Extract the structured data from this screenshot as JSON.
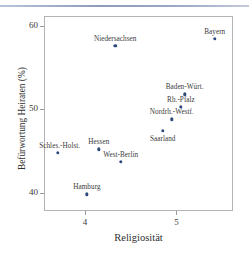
{
  "chart_data": {
    "type": "scatter",
    "title": "",
    "xlabel": "Religiosität",
    "ylabel": "Befürwortung Heiraten (%)",
    "xlim": [
      3.55,
      5.62
    ],
    "ylim": [
      37.8,
      61.2
    ],
    "xticks": [
      4,
      5
    ],
    "xticklabels": [
      "4",
      "5"
    ],
    "yticks": [
      40,
      50,
      60
    ],
    "yticklabels": [
      "40",
      "50",
      "60"
    ],
    "grid": false,
    "legend": null,
    "marker_color": "#2e4a7d",
    "points": [
      {
        "label": "Schles.-Holst.",
        "x": 3.7,
        "y": 44.8,
        "label_pos": "left-above"
      },
      {
        "label": "Hamburg",
        "x": 4.02,
        "y": 39.8,
        "label_pos": "above"
      },
      {
        "label": "Hessen",
        "x": 4.15,
        "y": 45.2,
        "label_pos": "above"
      },
      {
        "label": "Niedersachsen",
        "x": 4.33,
        "y": 57.6,
        "label_pos": "above"
      },
      {
        "label": "West-Berlin",
        "x": 4.39,
        "y": 43.7,
        "label_pos": "above"
      },
      {
        "label": "Saarland",
        "x": 4.85,
        "y": 47.4,
        "label_pos": "below"
      },
      {
        "label": "Nordrh.-Westf.",
        "x": 4.95,
        "y": 48.8,
        "label_pos": "above"
      },
      {
        "label": "Rh.-Pfalz",
        "x": 5.05,
        "y": 50.3,
        "label_pos": "above"
      },
      {
        "label": "Baden-Würt.",
        "x": 5.09,
        "y": 51.8,
        "label_pos": "above"
      },
      {
        "label": "Bayern",
        "x": 5.42,
        "y": 58.5,
        "label_pos": "above"
      }
    ]
  }
}
